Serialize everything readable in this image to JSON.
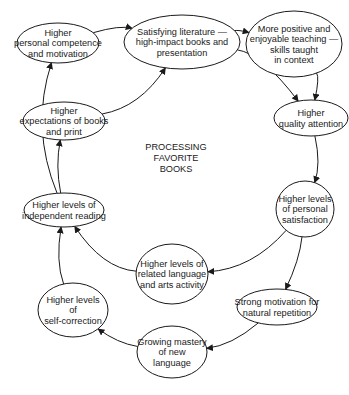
{
  "diagram": {
    "type": "cycle",
    "center_label": [
      "PROCESSING",
      "FAVORITE",
      "BOOKS"
    ],
    "colors": {
      "stroke": "#1a1a1a",
      "background": "#ffffff",
      "text": "#1a1a1a"
    },
    "nodes": [
      {
        "id": "n1",
        "lines": [
          "Higher",
          "personal competence",
          "and motivation"
        ],
        "cx": 58,
        "cy": 43,
        "rx": 41,
        "ry": 20
      },
      {
        "id": "n2",
        "lines": [
          "Satisfying literature —",
          "high-impact books and",
          "presentation"
        ],
        "cx": 182,
        "cy": 42,
        "rx": 58,
        "ry": 27
      },
      {
        "id": "n3",
        "lines": [
          "More positive and",
          "enjoyable teaching —",
          "skills taught",
          "in context"
        ],
        "cx": 294,
        "cy": 44,
        "rx": 48,
        "ry": 33
      },
      {
        "id": "n4",
        "lines": [
          "Higher",
          "quality attention"
        ],
        "cx": 311,
        "cy": 118,
        "rx": 37,
        "ry": 18
      },
      {
        "id": "n5",
        "lines": [
          "Higher",
          "expectations of books",
          "and print"
        ],
        "cx": 64,
        "cy": 121,
        "rx": 41,
        "ry": 19
      },
      {
        "id": "n6",
        "lines": [
          "Higher levels of",
          "independent reading"
        ],
        "cx": 64,
        "cy": 210,
        "rx": 40,
        "ry": 17
      },
      {
        "id": "n7",
        "lines": [
          "Higher levels",
          "of personal",
          "satisfaction"
        ],
        "cx": 305,
        "cy": 209,
        "rx": 29,
        "ry": 28
      },
      {
        "id": "n8",
        "lines": [
          "Higher levels of",
          "related language",
          "and arts activity"
        ],
        "cx": 172,
        "cy": 274,
        "rx": 36,
        "ry": 30
      },
      {
        "id": "n9",
        "lines": [
          "Higher levels",
          "of",
          "self-correction"
        ],
        "cx": 73,
        "cy": 310,
        "rx": 35,
        "ry": 27
      },
      {
        "id": "n10",
        "lines": [
          "Strong motivation for",
          "natural repetition"
        ],
        "cx": 277,
        "cy": 307,
        "rx": 40,
        "ry": 18
      },
      {
        "id": "n11",
        "lines": [
          "Growing mastery",
          "of new",
          "language"
        ],
        "cx": 172,
        "cy": 352,
        "rx": 35,
        "ry": 26
      }
    ],
    "edges": [
      {
        "from": "n1",
        "to": "n2",
        "path": "M 95 34 Q 107 29 122 34"
      },
      {
        "from": "n2",
        "to": "n3",
        "path": "M 238 35 Q 250 29 245 33 Q 252 30 246 33"
      },
      {
        "from": "n5",
        "to": "n2",
        "path": "M 72 102 Q 88 72 124 56"
      },
      {
        "from": "n2",
        "to": "n4",
        "path": "M 218 62 Q 260 78 300 99"
      },
      {
        "from": "n3",
        "to": "n4",
        "path": "M 314 77 Q 316 92 304 106"
      },
      {
        "from": "n4",
        "to": "n7",
        "path": "M 285 131 Q 292 150 290 182"
      },
      {
        "from": "n7",
        "to": "n8",
        "path": "M 283 230 Q 260 255 208 272"
      },
      {
        "from": "n7",
        "to": "n10",
        "path": "M 301 237 Q 304 262 295 289"
      },
      {
        "from": "n10",
        "to": "n11",
        "path": "M 252 323 Q 235 336 207 341"
      },
      {
        "from": "n11",
        "to": "n9",
        "path": "M 137 345 Q 120 339 106 326"
      },
      {
        "from": "n9",
        "to": "n6",
        "path": "M 71 283 Q 64 262 65 228"
      },
      {
        "from": "n8",
        "to": "n6",
        "path": "M 137 270 Q 100 255 77 228"
      },
      {
        "from": "n6",
        "to": "n5",
        "path": "M 62 193 Q 56 170 57 141"
      },
      {
        "from": "n6",
        "to": "n1",
        "path": "M 30 202 Q 14 120 23 57"
      }
    ]
  }
}
